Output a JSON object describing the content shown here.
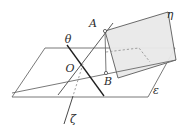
{
  "figure": {
    "type": "geometry-diagram",
    "background_color": "#ffffff",
    "stroke_color": "#4a4a4a",
    "accent_stroke_color": "#1a1a1a",
    "plane_fill_color": "#e8e8e8",
    "label_color": "#2b2b2b",
    "labels": {
      "plane_vertical": "η",
      "plane_horizontal": "ε",
      "line_theta": "θ",
      "line_zeta": "ζ",
      "point_a": "A",
      "point_b": "B",
      "point_o": "O"
    },
    "elements": {
      "horizontal_plane_name": "plane-epsilon",
      "vertical_plane_name": "plane-eta",
      "segment_ab_name": "segment-a-b",
      "line_theta_name": "line-theta",
      "line_zeta_name": "line-zeta",
      "hidden_edge_name": "hidden-dashed-edge"
    },
    "geometry": {
      "horizontal_plane_points": "45,48 175,48 148,97 12,97",
      "vertical_plane_points": "105,31 168,12 176,60 118,78",
      "segment_ab": {
        "x1": 105,
        "y1": 31,
        "x2": 106,
        "y2": 73
      },
      "line_theta": {
        "x1": 68,
        "y1": 46,
        "x2": 103,
        "y2": 95
      },
      "line_oa_extended": {
        "x1": 58,
        "y1": 94,
        "x2": 112,
        "y2": 24
      },
      "ridge_line": {
        "x1": 12,
        "y1": 93,
        "x2": 176,
        "y2": 60
      },
      "point_o": {
        "x": 76,
        "y": 67
      },
      "point_a": {
        "x": 105,
        "y": 31
      },
      "point_b": {
        "x": 106,
        "y": 73
      }
    }
  }
}
